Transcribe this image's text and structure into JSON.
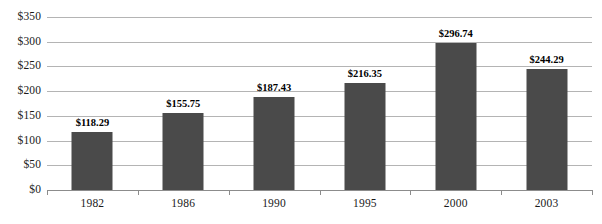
{
  "chart_data": {
    "type": "bar",
    "title": "",
    "subtitle": "",
    "xlabel": "",
    "ylabel": "",
    "categories": [
      "1982",
      "1986",
      "1990",
      "1995",
      "2000",
      "2003"
    ],
    "values": [
      118.29,
      155.75,
      187.43,
      216.35,
      296.74,
      244.29
    ],
    "data_labels": [
      "$118.29",
      "$155.75",
      "$187.43",
      "$216.35",
      "$296.74",
      "$244.29"
    ],
    "ylim": [
      0,
      350
    ],
    "ytick_values": [
      0,
      50,
      100,
      150,
      200,
      250,
      300,
      350
    ],
    "ytick_labels": [
      "$0",
      "$50",
      "$100",
      "$150",
      "$200",
      "$250",
      "$300",
      "$350"
    ],
    "grid": true,
    "grid_axis": "y",
    "legend": false,
    "legend_position": "none",
    "annotations": [],
    "colors": {
      "bar_fill": "#4a4a4a",
      "gridline": "#b4b4b4",
      "axis_line": "#8c8c8c",
      "text": "#1a1a1a",
      "data_label": "#000000",
      "background": "#ffffff"
    }
  }
}
